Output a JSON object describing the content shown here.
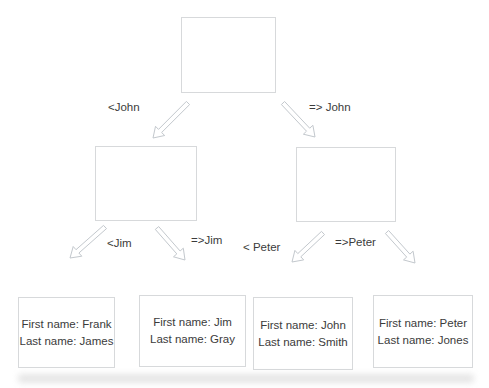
{
  "page": {
    "background": "#ffffff"
  },
  "diagram": {
    "type": "binary-decision-tree",
    "nodes": {
      "root": {
        "label": ""
      },
      "left_child": {
        "label": ""
      },
      "right_child": {
        "label": ""
      }
    },
    "edges": [
      {
        "from": "root",
        "to": "left_child",
        "label": "<John"
      },
      {
        "from": "root",
        "to": "right_child",
        "label": "=> John"
      },
      {
        "from": "left_child",
        "to": "leaf_0",
        "label": "<Jim"
      },
      {
        "from": "left_child",
        "to": "leaf_1",
        "label": "=>Jim"
      },
      {
        "from": "right_child",
        "to": "leaf_2",
        "label": "< Peter"
      },
      {
        "from": "right_child",
        "to": "leaf_3",
        "label": "=>Peter"
      }
    ],
    "leaves": [
      {
        "line1": "First name: Frank",
        "line2": "Last name: James"
      },
      {
        "line1": "First name: Jim",
        "line2": "Last name: Gray"
      },
      {
        "line1": "First name: John",
        "line2": "Last name: Smith"
      },
      {
        "line1": "First name: Peter",
        "line2": "Last name: Jones"
      }
    ],
    "colors": {
      "box_border": "#d7d9db",
      "box_fill": "#ffffff",
      "arrow_stroke": "#c3c8cd",
      "arrow_fill": "#ffffff",
      "text": "#3b3b3b"
    }
  }
}
